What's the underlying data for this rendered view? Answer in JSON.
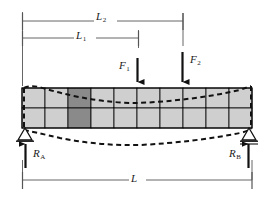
{
  "figure": {
    "name": "simply-supported-beam-fem-deflection-diagram",
    "colors": {
      "line": "#1a1a1a",
      "mesh_line": "#000000",
      "cell_fill": "#cfcfcf",
      "cell_fill_highlight": "#8a8a8a",
      "background": "#ffffff"
    }
  },
  "labels": {
    "L2": {
      "base": "L",
      "sub": "2"
    },
    "L1": {
      "base": "L",
      "sub": "1"
    },
    "F1": {
      "base": "F",
      "sub": "1"
    },
    "F2": {
      "base": "F",
      "sub": "2"
    },
    "RA": {
      "base": "R",
      "sub": "A"
    },
    "RB": {
      "base": "R",
      "sub": "B"
    },
    "L": {
      "base": "L",
      "sub": ""
    }
  },
  "dimensions": [
    {
      "id": "L2",
      "label": "L2",
      "y": 21,
      "x_start": 22,
      "x_end": 183
    },
    {
      "id": "L1",
      "label": "L1",
      "y": 38,
      "x_start": 22,
      "x_end": 138
    },
    {
      "id": "L",
      "label": "L",
      "y": 180,
      "x_start": 22,
      "x_end": 252
    }
  ],
  "loads": [
    {
      "id": "F1",
      "label": "F1",
      "x": 137,
      "y_start": 58,
      "y_end": 88,
      "direction": "down"
    },
    {
      "id": "F2",
      "label": "F2",
      "x": 182,
      "y_start": 52,
      "y_end": 88,
      "direction": "down"
    }
  ],
  "reactions": [
    {
      "id": "RA",
      "label": "RA",
      "x": 25,
      "y_start": 168,
      "y_end": 138,
      "direction": "up"
    },
    {
      "id": "RB",
      "label": "RB",
      "x": 249,
      "y_start": 168,
      "y_end": 138,
      "direction": "up"
    }
  ],
  "supports": [
    {
      "id": "support-a",
      "type": "pin",
      "x": 25,
      "y": 130
    },
    {
      "id": "support-b",
      "type": "roller",
      "x": 249,
      "y": 130
    }
  ],
  "beam": {
    "x_start": 22,
    "x_end": 252,
    "y_top": 88,
    "y_bottom": 128,
    "columns": 10,
    "rows": 2,
    "highlight_cell": {
      "row": 0,
      "col": 2
    }
  },
  "deflection": {
    "style": "dashed",
    "top_curve_sag": 7,
    "bottom_curve_sag": 13,
    "description": "deformed-shape-outline"
  }
}
